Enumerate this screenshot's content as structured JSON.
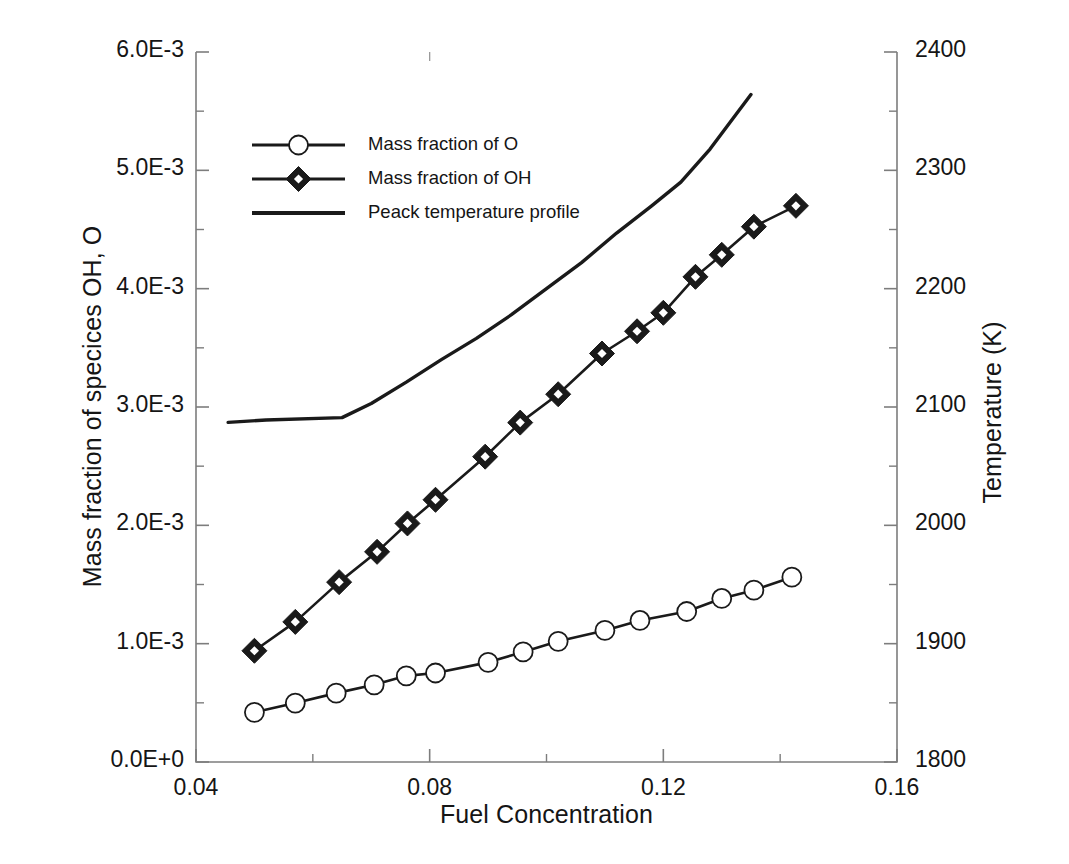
{
  "chart_data": {
    "type": "line",
    "title": "",
    "xlabel": "Fuel Concentration",
    "ylabel": "Mass fraction of specices OH, O",
    "ylabel_secondary": "Temperature (K)",
    "xlim": [
      0.04,
      0.16
    ],
    "ylim": [
      0.0,
      0.006
    ],
    "ylim_secondary": [
      1800,
      2400
    ],
    "xticks": [
      0.04,
      0.08,
      0.12,
      0.16
    ],
    "xtick_labels": [
      "0.04",
      "0.08",
      "0.12",
      "0.16"
    ],
    "x_minor_interval": 0.02,
    "yticks": [
      0.0,
      0.001,
      0.002,
      0.003,
      0.004,
      0.005,
      0.006
    ],
    "ytick_labels": [
      "0.0E+0",
      "1.0E-3",
      "2.0E-3",
      "3.0E-3",
      "4.0E-3",
      "5.0E-3",
      "6.0E-3"
    ],
    "y_minor_interval": 0.0005,
    "yticks_secondary": [
      1800,
      1900,
      2000,
      2100,
      2200,
      2300,
      2400
    ],
    "ytick_labels_secondary": [
      "1800",
      "1900",
      "2000",
      "2100",
      "2200",
      "2300",
      "2400"
    ],
    "y_secondary_minor_interval": 50,
    "grid": false,
    "legend_position": "upper-left-inside",
    "line_color": "#1a1a1a",
    "marker_face_color": "#ffffff",
    "series": [
      {
        "name": "Mass fraction of O",
        "axis": "left",
        "marker": "circle",
        "x": [
          0.05,
          0.057,
          0.064,
          0.0705,
          0.076,
          0.081,
          0.09,
          0.096,
          0.102,
          0.11,
          0.116,
          0.124,
          0.13,
          0.1355,
          0.142
        ],
        "y": [
          0.00042,
          0.000498,
          0.000582,
          0.000652,
          0.000728,
          0.000752,
          0.000842,
          0.00093,
          0.00102,
          0.001112,
          0.001196,
          0.001272,
          0.001382,
          0.001452,
          0.001562
        ]
      },
      {
        "name": "Mass fraction of OH",
        "axis": "left",
        "marker": "diamond",
        "x": [
          0.05,
          0.057,
          0.0645,
          0.071,
          0.0762,
          0.081,
          0.0895,
          0.0955,
          0.102,
          0.1095,
          0.1155,
          0.12,
          0.1255,
          0.13,
          0.1355,
          0.1427
        ],
        "y": [
          0.00094,
          0.001184,
          0.00152,
          0.001776,
          0.002016,
          0.002216,
          0.00258,
          0.002868,
          0.003108,
          0.003452,
          0.00364,
          0.003796,
          0.0041,
          0.004286,
          0.004524,
          0.0047
        ]
      },
      {
        "name": "Peack temperature profile",
        "axis": "right",
        "marker": "none",
        "x": [
          0.0455,
          0.052,
          0.065,
          0.07,
          0.076,
          0.082,
          0.088,
          0.094,
          0.1,
          0.106,
          0.112,
          0.118,
          0.123,
          0.128,
          0.135
        ],
        "y": [
          2087,
          2089,
          2091,
          2103,
          2121,
          2140,
          2158,
          2178,
          2200,
          2222,
          2247,
          2270,
          2290,
          2318,
          2364
        ]
      }
    ]
  },
  "legend": {
    "entries": [
      {
        "label": "Mass fraction of O",
        "marker": "circle-marker"
      },
      {
        "label": "Mass fraction of OH",
        "marker": "diamond-marker"
      },
      {
        "label": "Peack temperature profile",
        "marker": "plain-line"
      }
    ]
  }
}
